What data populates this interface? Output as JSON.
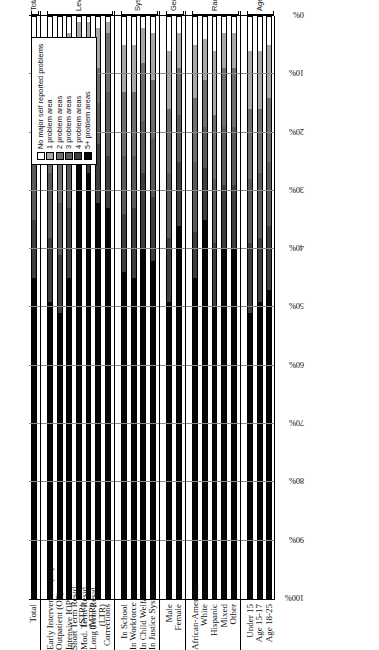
{
  "chart_data": {
    "type": "bar",
    "subtype": "stacked-horizontal-100pct",
    "title": "",
    "xlabel": "",
    "ylabel": "",
    "xlim": [
      0,
      100
    ],
    "x_axis_direction": "reversed (100% at left, 0% at right)",
    "grid": true,
    "legend_position": "upper-right inside plot",
    "tick_labels": [
      "100%",
      "90%",
      "80%",
      "70%",
      "60%",
      "50%",
      "40%",
      "30%",
      "20%",
      "10%",
      "0%"
    ],
    "tick_values": [
      100,
      90,
      80,
      70,
      60,
      50,
      40,
      30,
      20,
      10,
      0
    ],
    "series": [
      {
        "name": "No major self reported problems",
        "color": "#ffffff"
      },
      {
        "name": "1 problem area",
        "color": "#a8a8a8"
      },
      {
        "name": "2 problem areas",
        "color": "#6e6e6e"
      },
      {
        "name": "3 problem areas",
        "color": "#5a5a5a"
      },
      {
        "name": "4 problem areas",
        "color": "#3d3d3d"
      },
      {
        "name": "5+ problem areas",
        "color": "#060606"
      }
    ],
    "groups": [
      {
        "group": "Total",
        "categories": [
          "Total"
        ],
        "values": [
          [
            6,
            9,
            10,
            10,
            10,
            55
          ]
        ]
      },
      {
        "group": "Level of Care",
        "categories": [
          "Early Intervention (EI)",
          "Outpatient (OP)",
          "Intensive IOP",
          "Short Term Resid. (STR)",
          "Mod. Term Resid. (MTR)",
          "Long Term Resid. (LTR)",
          "Corrections"
        ],
        "values": [
          [
            5,
            10,
            12,
            11,
            11,
            51
          ],
          [
            10,
            11,
            11,
            9,
            10,
            49
          ],
          [
            3,
            7,
            12,
            11,
            12,
            55
          ],
          [
            1,
            4,
            3,
            5,
            5,
            82
          ],
          [
            1,
            5,
            6,
            6,
            9,
            73
          ],
          [
            2,
            7,
            6,
            7,
            10,
            68
          ],
          [
            1,
            2,
            10,
            11,
            9,
            67
          ]
        ]
      },
      {
        "group": "System Involvement",
        "categories": [
          "In School",
          "In Workforce",
          "In Child Welfare",
          "In Justice System"
        ],
        "values": [
          [
            5,
            8,
            11,
            10,
            10,
            56
          ],
          [
            5,
            8,
            11,
            9,
            12,
            55
          ],
          [
            2,
            6,
            10,
            9,
            13,
            60
          ],
          [
            3,
            8,
            10,
            10,
            11,
            58
          ]
        ]
      },
      {
        "group": "Gender",
        "categories": [
          "Male",
          "Female"
        ],
        "values": [
          [
            6,
            10,
            11,
            11,
            11,
            51
          ],
          [
            3,
            6,
            8,
            8,
            11,
            64
          ]
        ]
      },
      {
        "group": "Race Group",
        "categories": [
          "African-American",
          "White",
          "Hispanic",
          "Mixed",
          "Other"
        ],
        "values": [
          [
            5,
            9,
            11,
            12,
            8,
            55
          ],
          [
            4,
            7,
            8,
            7,
            9,
            65
          ],
          [
            6,
            11,
            11,
            11,
            11,
            50
          ],
          [
            3,
            6,
            10,
            10,
            11,
            60
          ],
          [
            3,
            6,
            10,
            10,
            11,
            60
          ]
        ]
      },
      {
        "group": "Age Group",
        "categories": [
          "Under 15",
          "Age 15-17",
          "Age 18-25"
        ],
        "values": [
          [
            6,
            10,
            12,
            11,
            12,
            49
          ],
          [
            6,
            10,
            11,
            11,
            11,
            51
          ],
          [
            5,
            9,
            11,
            11,
            11,
            53
          ]
        ]
      }
    ]
  },
  "legend": {
    "items": [
      "No major self reported problems",
      "1 problem area",
      "2 problem areas",
      "3 problem areas",
      "4 problem areas",
      "5+ problem areas"
    ]
  },
  "axis": {
    "ticks": [
      "100%",
      "90%",
      "80%",
      "70%",
      "60%",
      "50%",
      "40%",
      "30%",
      "20%",
      "10%",
      "0%"
    ]
  },
  "group_labels": [
    "Total",
    "Level of Care",
    "System Involvement",
    "Gender",
    "Race Group",
    "Age Group"
  ],
  "category_labels": [
    "Total",
    "Early Intervention (EI)",
    "Outpatient (OP)",
    "Intensive IOP",
    "Short Term Resid.",
    "(STR)",
    "Mod. Term Resid.",
    "(MTR)",
    "Long Term Resid.",
    "(LTR)",
    "Corrections",
    "In School",
    "In Workforce",
    "In Child Welfare",
    "In Justice System",
    "Male",
    "Female",
    "African-American",
    "White",
    "Hispanic",
    "Mixed",
    "Other",
    "Under 15",
    "Age 15-17",
    "Age 18-25"
  ]
}
